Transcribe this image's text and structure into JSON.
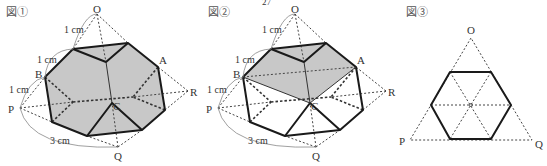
{
  "page_number": "27",
  "figures": [
    {
      "title": "図①",
      "labels": {
        "O": "O",
        "A": "A",
        "B": "B",
        "C": "C",
        "P": "P",
        "Q": "Q",
        "R": "R"
      },
      "measurements": [
        "1 cm",
        "1 cm",
        "1 cm",
        "3 cm"
      ],
      "shaded_region": "entire truncated face"
    },
    {
      "title": "図②",
      "labels": {
        "O": "O",
        "A": "A",
        "B": "B",
        "C": "C",
        "P": "P",
        "Q": "Q",
        "R": "R"
      },
      "measurements": [
        "1 cm",
        "1 cm",
        "1 cm",
        "3 cm"
      ],
      "shaded_region": "cross-section through B, A, C"
    },
    {
      "title": "図③",
      "labels": {
        "O": "O",
        "P": "P",
        "Q": "Q"
      },
      "description": "regular hexagon inscribed in equilateral triangle OPQ"
    }
  ]
}
